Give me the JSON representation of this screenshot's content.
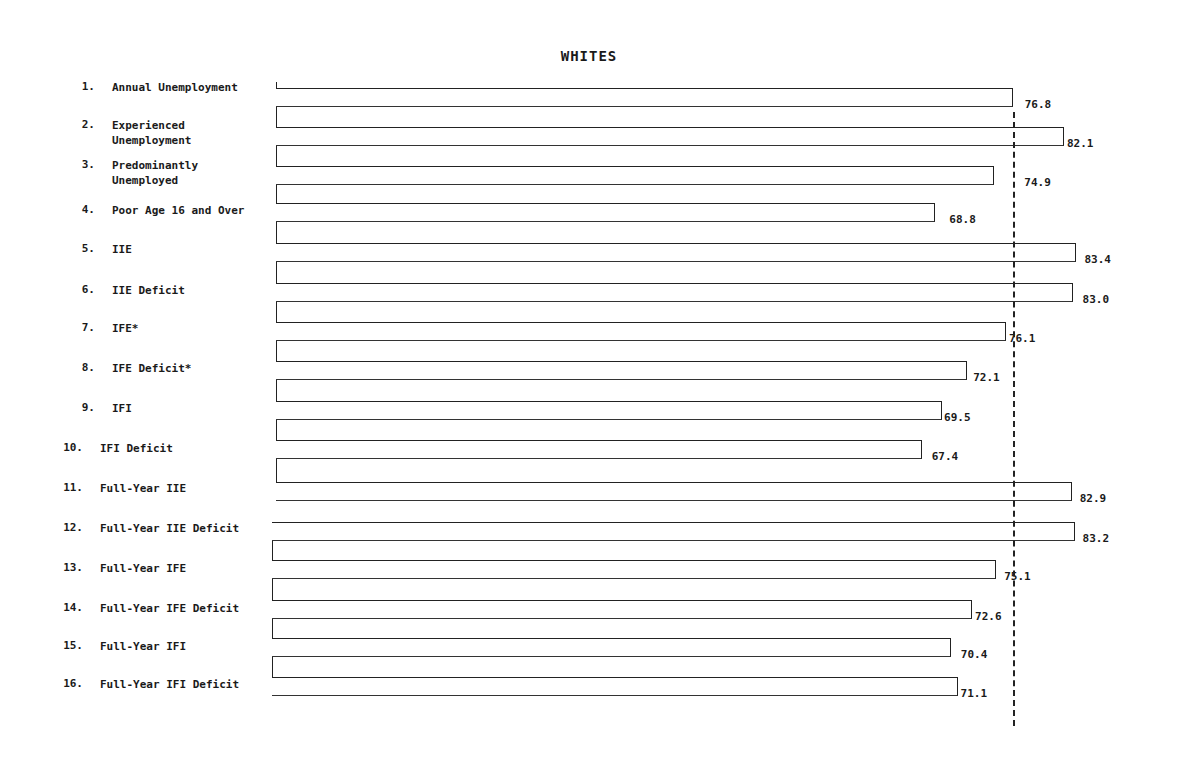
{
  "chart_data": {
    "type": "bar",
    "orientation": "horizontal",
    "title": "WHITES",
    "xlabel": "",
    "ylabel": "",
    "xlim": [
      0,
      85
    ],
    "grid": false,
    "legend": null,
    "reference_line": {
      "style": "dashed",
      "value": 76.8
    },
    "categories": [
      "1. Annual Unemployment",
      "2. Experienced Unemployment",
      "3. Predominantly Unemployed",
      "4. Poor Age 16 and Over",
      "5. IIE",
      "6. IIE Deficit",
      "7. IFE*",
      "8. IFE Deficit*",
      "9. IFI",
      "10. IFI Deficit",
      "11. Full-Year IIE",
      "12. Full-Year IIE Deficit",
      "13. Full-Year IFE",
      "14. Full-Year IFE Deficit",
      "15. Full-Year IFI",
      "16. Full-Year IFI Deficit"
    ],
    "values": [
      76.8,
      82.1,
      74.9,
      68.8,
      83.4,
      83.0,
      76.1,
      72.1,
      69.5,
      67.4,
      82.9,
      83.2,
      75.1,
      72.6,
      70.4,
      71.1
    ]
  },
  "title": "WHITES",
  "rows": [
    {
      "num": "1.",
      "label": "Annual Unemployment",
      "value": "76.8"
    },
    {
      "num": "2.",
      "label": "Experienced\nUnemployment",
      "value": "82.1"
    },
    {
      "num": "3.",
      "label": "Predominantly\nUnemployed",
      "value": "74.9"
    },
    {
      "num": "4.",
      "label": "Poor Age 16 and Over",
      "value": "68.8"
    },
    {
      "num": "5.",
      "label": "IIE",
      "value": "83.4"
    },
    {
      "num": "6.",
      "label": "IIE Deficit",
      "value": "83.0"
    },
    {
      "num": "7.",
      "label": "IFE*",
      "value": "76.1"
    },
    {
      "num": "8.",
      "label": "IFE Deficit*",
      "value": "72.1"
    },
    {
      "num": "9.",
      "label": "IFI",
      "value": "69.5"
    },
    {
      "num": "10.",
      "label": "IFI Deficit",
      "value": "67.4"
    },
    {
      "num": "11.",
      "label": "Full-Year IIE",
      "value": "82.9"
    },
    {
      "num": "12.",
      "label": "Full-Year IIE Deficit",
      "value": "83.2"
    },
    {
      "num": "13.",
      "label": "Full-Year IFE",
      "value": "75.1"
    },
    {
      "num": "14.",
      "label": "Full-Year IFE Deficit",
      "value": "72.6"
    },
    {
      "num": "15.",
      "label": "Full-Year IFI",
      "value": "70.4"
    },
    {
      "num": "16.",
      "label": "Full-Year IFI Deficit",
      "value": "71.1"
    }
  ],
  "colors": {
    "ink": "#222222",
    "background": "#ffffff"
  }
}
